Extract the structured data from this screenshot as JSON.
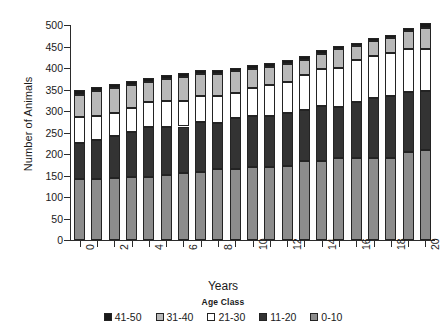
{
  "chart_data": {
    "type": "bar",
    "stacked": true,
    "title": "",
    "xlabel": "Years",
    "ylabel": "Number of Animals",
    "legend_title": "Age Class",
    "legend_position": "bottom",
    "grid": false,
    "ylim": [
      0,
      500
    ],
    "yticks": [
      0,
      50,
      100,
      150,
      200,
      250,
      300,
      350,
      400,
      450,
      500
    ],
    "ytick_labels": [
      "0",
      "50",
      "100",
      "150",
      "200",
      "250",
      "300",
      "350",
      "400",
      "450",
      "500"
    ],
    "categories": [
      0,
      1,
      2,
      3,
      4,
      5,
      6,
      7,
      8,
      9,
      10,
      11,
      12,
      13,
      14,
      15,
      16,
      17,
      18,
      19,
      20
    ],
    "xtick_labels": [
      "0",
      "",
      "2",
      "",
      "4",
      "",
      "6",
      "",
      "8",
      "",
      "10",
      "",
      "12",
      "",
      "14",
      "",
      "16",
      "",
      "18",
      "",
      "20"
    ],
    "xlim": [
      -0.5,
      20.5
    ],
    "series": [
      {
        "name": "0-10",
        "color": "#8c8c8c",
        "values": [
          142,
          141,
          144,
          147,
          146,
          151,
          155,
          158,
          164,
          166,
          170,
          170,
          171,
          183,
          183,
          191,
          191,
          191,
          191,
          205,
          209
        ]
      },
      {
        "name": "11-20",
        "color": "#333333",
        "values": [
          83,
          92,
          99,
          105,
          116,
          112,
          109,
          116,
          108,
          118,
          119,
          119,
          124,
          120,
          129,
          119,
          131,
          139,
          144,
          139,
          137
        ]
      },
      {
        "name": "21-30",
        "color": "#ffffff",
        "values": [
          61,
          56,
          52,
          56,
          59,
          61,
          59,
          60,
          63,
          58,
          64,
          71,
          73,
          80,
          86,
          91,
          96,
          98,
          100,
          101,
          99
        ]
      },
      {
        "name": "31-40",
        "color": "#b8b8b8",
        "values": [
          51,
          57,
          58,
          52,
          46,
          51,
          56,
          51,
          51,
          50,
          44,
          42,
          42,
          36,
          35,
          43,
          33,
          35,
          34,
          40,
          47
        ]
      },
      {
        "name": "41-50",
        "color": "#1a1a1a",
        "values": [
          13,
          9,
          10,
          10,
          9,
          9,
          10,
          10,
          10,
          9,
          9,
          9,
          9,
          9,
          8,
          8,
          8,
          6,
          7,
          7,
          13
        ]
      }
    ],
    "totals": [
      350,
      355,
      363,
      370,
      376,
      384,
      389,
      395,
      396,
      401,
      406,
      411,
      419,
      428,
      441,
      452,
      459,
      469,
      476,
      492,
      505
    ]
  },
  "legend": {
    "title": "Age Class",
    "items": [
      {
        "label": "41-50",
        "color": "#1a1a1a"
      },
      {
        "label": "31-40",
        "color": "#b8b8b8"
      },
      {
        "label": "21-30",
        "color": "#ffffff"
      },
      {
        "label": "11-20",
        "color": "#333333"
      },
      {
        "label": "0-10",
        "color": "#8c8c8c"
      }
    ]
  },
  "axes": {
    "xlabel": "Years",
    "ylabel": "Number of Animals"
  }
}
